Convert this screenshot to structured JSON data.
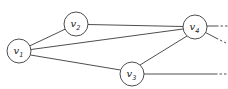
{
  "diagram": {
    "type": "graph",
    "nodes": [
      {
        "id": "v1",
        "base": "v",
        "sub": "1",
        "cx": 19,
        "cy": 51,
        "r": 12
      },
      {
        "id": "v2",
        "base": "v",
        "sub": "2",
        "cx": 76,
        "cy": 24,
        "r": 12
      },
      {
        "id": "v3",
        "base": "v",
        "sub": "3",
        "cx": 132,
        "cy": 74,
        "r": 12
      },
      {
        "id": "v4",
        "base": "v",
        "sub": "4",
        "cx": 195,
        "cy": 27,
        "r": 12
      }
    ],
    "edges": [
      {
        "from": "v1",
        "to": "v2"
      },
      {
        "from": "v1",
        "to": "v4"
      },
      {
        "from": "v1",
        "to": "v3"
      },
      {
        "from": "v2",
        "to": "v4"
      },
      {
        "from": "v3",
        "to": "v4"
      }
    ],
    "open_edges": [
      {
        "from": "v4",
        "direction": "right"
      },
      {
        "from": "v4",
        "direction": "down-right"
      },
      {
        "from": "v3",
        "direction": "right"
      }
    ],
    "colors": {
      "stroke": "#3a3a3a",
      "fill": "#ffffff",
      "text": "#222222"
    }
  }
}
